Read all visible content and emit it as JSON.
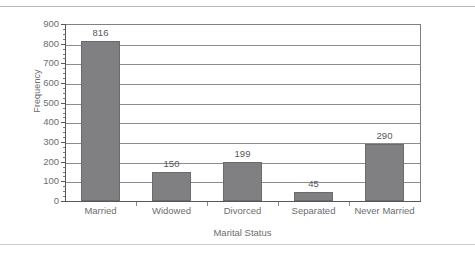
{
  "chart_data": {
    "type": "bar",
    "title": "",
    "subtitle": "",
    "xlabel": "Marital Status",
    "ylabel": "Frequency",
    "categories": [
      "Married",
      "Widowed",
      "Divorced",
      "Separated",
      "Never Married"
    ],
    "values": [
      816,
      150,
      199,
      45,
      290
    ],
    "data_labels": [
      "816",
      "150",
      "199",
      "45",
      "290"
    ],
    "ylim": [
      0,
      900
    ],
    "ytick_labels": [
      "900",
      "800",
      "700",
      "600",
      "500",
      "400",
      "300",
      "200",
      "100",
      "0"
    ],
    "ytick_values": [
      900,
      800,
      700,
      600,
      500,
      400,
      300,
      200,
      100,
      0
    ],
    "ytick_step": 100,
    "minor_ticks_per_interval": 4,
    "grid": "horizontal",
    "legend": "none",
    "bar_color": "#808083",
    "bar_edge_color": "#6b6b6e",
    "axis_color": "#58585a",
    "gridline_color": "#8c8c8f",
    "text_color": "#6d6d6f",
    "background": "#ffffff"
  }
}
